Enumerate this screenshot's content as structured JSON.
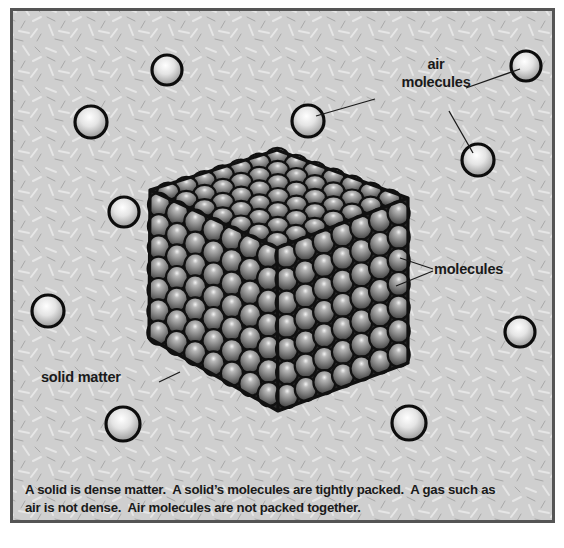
{
  "diagram": {
    "labels": {
      "air_molecules_line1": "air",
      "air_molecules_line2": "molecules",
      "molecules": "molecules",
      "solid_matter": "solid matter"
    },
    "caption": {
      "line1": "A solid is dense matter.  A solid’s molecules are tightly packed.  A gas such as",
      "line2": "air is not dense.  Air molecules are not packed together."
    },
    "air_molecules": [
      {
        "cx": 88,
        "cy": 119,
        "r": 16
      },
      {
        "cx": 164,
        "cy": 67,
        "r": 15
      },
      {
        "cx": 305,
        "cy": 118,
        "r": 16
      },
      {
        "cx": 523,
        "cy": 63,
        "r": 15
      },
      {
        "cx": 475,
        "cy": 157,
        "r": 16
      },
      {
        "cx": 121,
        "cy": 209,
        "r": 15
      },
      {
        "cx": 45,
        "cy": 308,
        "r": 16
      },
      {
        "cx": 517,
        "cy": 329,
        "r": 15
      },
      {
        "cx": 120,
        "cy": 421,
        "r": 17
      },
      {
        "cx": 406,
        "cy": 420,
        "r": 17
      }
    ],
    "solid_cube": {
      "top": [
        274,
        147
      ],
      "upper_left": [
        147,
        187
      ],
      "upper_right": [
        405,
        195
      ],
      "center": [
        274,
        245
      ],
      "lower_left": [
        146,
        335
      ],
      "lower_right": [
        405,
        360
      ],
      "bottom": [
        275,
        408
      ],
      "grid_top": 7,
      "grid_rows": 7
    },
    "colors": {
      "background": "#cfcfcf",
      "frame_border": "#555555",
      "outline": "#111111",
      "text": "#1a1a1a"
    }
  }
}
